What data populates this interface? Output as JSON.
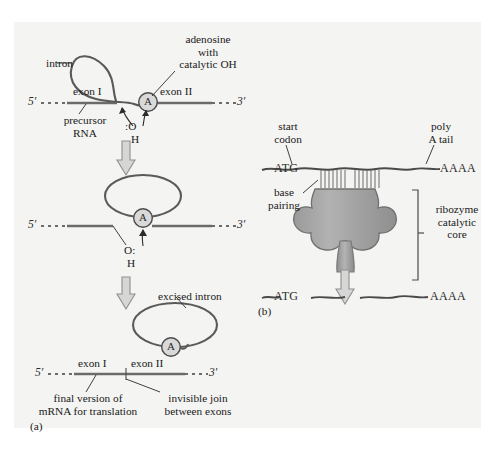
{
  "figure": {
    "background_color": "#f4f4f2",
    "strand_color": "#6b6b6b",
    "dark_strand_color": "#4a4a4a",
    "outline_color": "#5a5a5a",
    "ribozyme_fill": "#a8a8a8",
    "arrow_fill": "#d6d6d6",
    "text_color": "#1a1a1a"
  },
  "panel_a": {
    "letter": "(a)",
    "step1": {
      "label_intron": "intron",
      "label_adenosine": "adenosine\nwith\ncatalytic OH",
      "label_precursor": "precursor\nRNA",
      "exon1": "exon I",
      "exon2": "exon II",
      "five_prime": "5′",
      "three_prime": "3′",
      "node_a": "A",
      "oh_o": ":O",
      "oh_h": "H"
    },
    "step2": {
      "five_prime": "5′",
      "three_prime": "3′",
      "node_a": "A",
      "oh_o": "O:",
      "oh_h": "H"
    },
    "step3": {
      "label_excised": "excised intron",
      "exon1": "exon I",
      "exon2": "exon II",
      "five_prime": "5′",
      "three_prime": "3′",
      "node_a": "A",
      "label_final": "final version of\nmRNA for translation",
      "label_join": "invisible join\nbetween exons"
    }
  },
  "panel_b": {
    "letter": "(b)",
    "label_start_codon": "start\ncodon",
    "label_poly_a": "poly\nA tail",
    "label_base_pairing": "base\npairing",
    "label_ribozyme": "ribozyme\ncatalytic\ncore",
    "seq_start": "ATG",
    "seq_polya": "AAAA",
    "seq_start_after": "ATG",
    "seq_polya_after": "AAAA"
  }
}
